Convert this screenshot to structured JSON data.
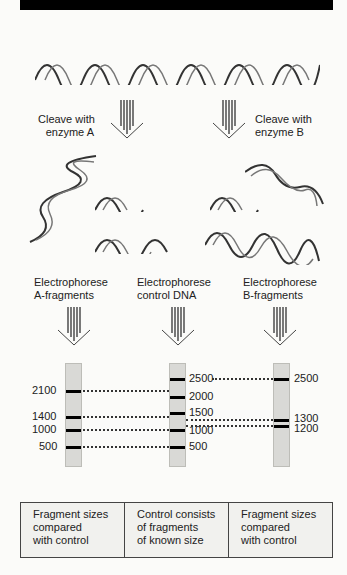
{
  "title_bar": "",
  "steps": {
    "cleave_a": "Cleave with\nenzyme A",
    "cleave_b": "Cleave with\nenzyme B",
    "electro_a": "Electrophorese\nA-fragments",
    "electro_control": "Electrophorese\ncontrol DNA",
    "electro_b": "Electrophorese\nB-fragments"
  },
  "gels": {
    "a_fragments": {
      "bands_bp": [
        2100,
        1400,
        1000,
        500
      ],
      "labels": [
        "2100",
        "1400",
        "1000",
        "500"
      ]
    },
    "control": {
      "bands_bp": [
        2500,
        2000,
        1500,
        1000,
        500
      ],
      "labels": [
        "2500",
        "2000",
        "1500",
        "1000",
        "500"
      ]
    },
    "b_fragments": {
      "bands_bp": [
        2500,
        1300,
        1200
      ],
      "labels": [
        "2500",
        "1300",
        "1200"
      ]
    }
  },
  "captions": [
    "Fragment sizes\ncompared\nwith control",
    "Control consists\nof fragments\nof known size",
    "Fragment sizes\ncompared\nwith control"
  ]
}
